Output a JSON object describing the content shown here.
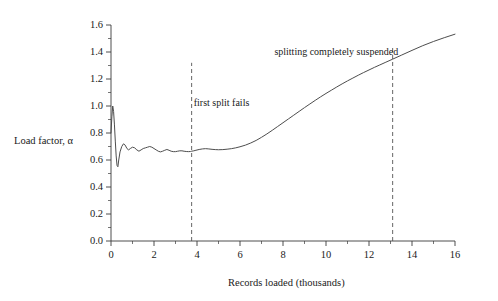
{
  "chart_data": {
    "type": "line",
    "title": "",
    "xlabel": "Records loaded (thousands)",
    "ylabel": "Load factor, α",
    "xlim": [
      0,
      16
    ],
    "ylim": [
      0.0,
      1.6
    ],
    "grid": false,
    "legend": "none",
    "xticks": [
      "0",
      "2",
      "4",
      "6",
      "8",
      "10",
      "12",
      "14",
      "16"
    ],
    "xtick_values": [
      0,
      2,
      4,
      6,
      8,
      10,
      12,
      14,
      16
    ],
    "xminor_values": [
      1,
      3,
      5,
      7,
      9,
      11,
      13,
      15
    ],
    "yticks": [
      "0.0",
      "0.2",
      "0.4",
      "0.6",
      "0.8",
      "1.0",
      "1.2",
      "1.4",
      "1.6"
    ],
    "ytick_values": [
      0.0,
      0.2,
      0.4,
      0.6,
      0.8,
      1.0,
      1.2,
      1.4,
      1.6
    ],
    "yminor_values": [
      0.1,
      0.3,
      0.5,
      0.7,
      0.9,
      1.1,
      1.3,
      1.5
    ],
    "line_color": "#4d4d4d",
    "axis_color": "#3a3a3a",
    "series": [
      {
        "name": "load factor",
        "x": [
          0.0,
          0.04,
          0.08,
          0.12,
          0.16,
          0.2,
          0.24,
          0.28,
          0.32,
          0.36,
          0.42,
          0.5,
          0.58,
          0.66,
          0.74,
          0.82,
          0.9,
          1.0,
          1.1,
          1.2,
          1.3,
          1.4,
          1.5,
          1.6,
          1.7,
          1.8,
          1.9,
          2.0,
          2.1,
          2.2,
          2.3,
          2.4,
          2.5,
          2.6,
          2.7,
          2.8,
          2.9,
          3.0,
          3.1,
          3.2,
          3.3,
          3.4,
          3.5,
          3.6,
          3.7,
          3.75,
          3.85,
          3.95,
          4.1,
          4.25,
          4.4,
          4.55,
          4.7,
          4.85,
          5.0,
          5.2,
          5.4,
          5.6,
          5.8,
          6.0,
          6.25,
          6.5,
          6.75,
          7.0,
          7.25,
          7.5,
          7.75,
          8.0,
          8.25,
          8.5,
          8.75,
          9.0,
          9.25,
          9.5,
          9.75,
          10.0,
          10.25,
          10.5,
          10.75,
          11.0,
          11.25,
          11.5,
          11.75,
          12.0,
          12.25,
          12.5,
          12.75,
          13.1,
          13.5,
          14.0,
          14.5,
          15.0,
          15.5,
          16.0
        ],
        "y": [
          0.8,
          0.92,
          1.0,
          0.96,
          0.86,
          0.74,
          0.63,
          0.56,
          0.55,
          0.6,
          0.66,
          0.7,
          0.72,
          0.71,
          0.685,
          0.675,
          0.685,
          0.695,
          0.69,
          0.675,
          0.665,
          0.675,
          0.685,
          0.69,
          0.695,
          0.7,
          0.695,
          0.685,
          0.675,
          0.665,
          0.66,
          0.665,
          0.672,
          0.678,
          0.672,
          0.665,
          0.662,
          0.662,
          0.665,
          0.668,
          0.668,
          0.665,
          0.663,
          0.662,
          0.663,
          0.665,
          0.668,
          0.672,
          0.678,
          0.682,
          0.684,
          0.682,
          0.679,
          0.677,
          0.676,
          0.677,
          0.68,
          0.684,
          0.69,
          0.698,
          0.71,
          0.726,
          0.745,
          0.768,
          0.793,
          0.82,
          0.848,
          0.876,
          0.904,
          0.932,
          0.96,
          0.988,
          1.015,
          1.042,
          1.068,
          1.093,
          1.117,
          1.141,
          1.164,
          1.186,
          1.207,
          1.228,
          1.248,
          1.267,
          1.286,
          1.304,
          1.322,
          1.347,
          1.376,
          1.412,
          1.447,
          1.478,
          1.506,
          1.532
        ]
      }
    ],
    "annotations": [
      {
        "name": "first-split-fails",
        "text": "first split fails",
        "x": 3.75,
        "label_x": 3.85,
        "label_y": 1.02,
        "vline": true,
        "vline_top_y": 1.32
      },
      {
        "name": "splitting-completely-suspended",
        "text": "splitting completely suspended",
        "x": 13.1,
        "label_x": 7.6,
        "label_y": 1.4,
        "vline": true,
        "vline_top_y": 1.45
      }
    ]
  }
}
